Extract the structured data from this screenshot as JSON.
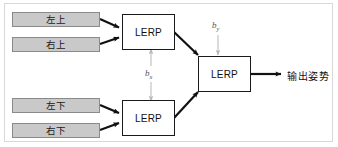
{
  "diagram": {
    "colors": {
      "input_fill": "#c9c9c9",
      "input_border": "#8a8a8a",
      "node_fill": "#ffffff",
      "node_border": "#1a1a1a",
      "arrow_dark": "#111111",
      "arrow_light": "#b8b8b8",
      "frame_border": "#d8d8d8",
      "text": "#111111",
      "blend_text": "#555555"
    },
    "inputs": [
      {
        "id": "top-left",
        "label": "左上"
      },
      {
        "id": "top-right",
        "label": "右上"
      },
      {
        "id": "bottom-left",
        "label": "左下"
      },
      {
        "id": "bottom-right",
        "label": "右下"
      }
    ],
    "nodes": [
      {
        "id": "lerp-top",
        "label": "LERP"
      },
      {
        "id": "lerp-bottom",
        "label": "LERP"
      },
      {
        "id": "lerp-final",
        "label": "LERP"
      }
    ],
    "blend_factors": [
      {
        "id": "bx",
        "base": "b",
        "sub": "x"
      },
      {
        "id": "by",
        "base": "b",
        "sub": "y"
      }
    ],
    "output": {
      "label": "输出姿势"
    }
  }
}
